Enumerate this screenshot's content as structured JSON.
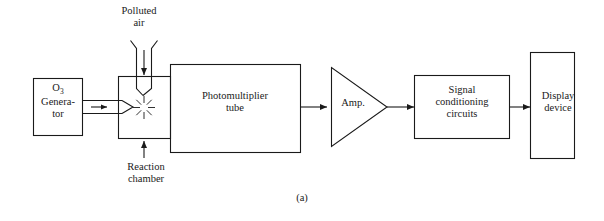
{
  "figure": {
    "caption": "(a)",
    "line_color": "#1a1a1a",
    "background_color": "#ffffff"
  },
  "blocks": {
    "ozone_generator": {
      "label_line1": "O",
      "label_sub": "3",
      "label_line2": "Genera-",
      "label_line3": "tor",
      "shape": "rectangle"
    },
    "reaction_chamber": {
      "label": "Reaction\nchamber",
      "shape": "rectangle",
      "contains_icon": "starburst-flash-icon"
    },
    "photomultiplier_tube": {
      "label": "Photomultiplier\ntube",
      "shape": "rectangle"
    },
    "amplifier": {
      "label": "Amp.",
      "shape": "triangle"
    },
    "signal_conditioning": {
      "label": "Signal\nconditioning\ncircuits",
      "shape": "rectangle"
    },
    "display_device": {
      "label": "Display\ndevice",
      "shape": "rectangle"
    }
  },
  "inputs": {
    "polluted_air": {
      "label": "Polluted\nair",
      "icon": "down-arrow-icon"
    }
  },
  "connectors": {
    "generator_to_chamber": "ozone-pipe-arrow",
    "chamber_to_pmt": "double-line-coupling",
    "pmt_to_amp": "signal-arrow",
    "amp_to_signal_conditioning": "signal-arrow",
    "signal_conditioning_to_display": "signal-arrow"
  }
}
